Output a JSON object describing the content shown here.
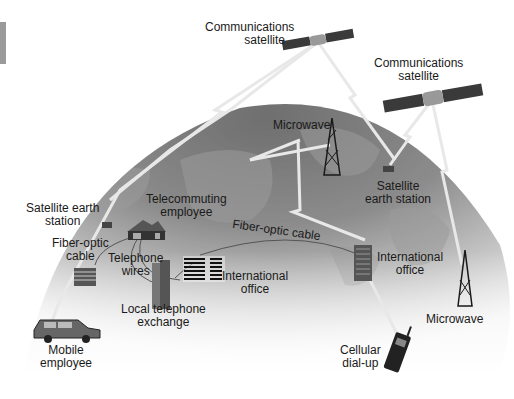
{
  "diagram": {
    "colors": {
      "globe_dark": "#7a7a7a",
      "globe_light": "#e8e8e8",
      "link": "#e6e6e6",
      "background": "#ffffff"
    },
    "labels": {
      "comm_sat_1": {
        "line1": "Communications",
        "line2": "satellite"
      },
      "comm_sat_2": {
        "line1": "Communications",
        "line2": "satellite"
      },
      "microwave_top": {
        "line1": "Microwave"
      },
      "sat_earth_station_right": {
        "line1": "Satellite",
        "line2": "earth station"
      },
      "sat_earth_station_left": {
        "line1": "Satellite earth",
        "line2": "station"
      },
      "telecommuting": {
        "line1": "Telecommuting",
        "line2": "employee"
      },
      "fiber_optic_left": {
        "line1": "Fiber-optic",
        "line2": "cable"
      },
      "fiber_optic_arc": {
        "line1": "Fiber-optic cable"
      },
      "telephone_wires": {
        "line1": "Telephone",
        "line2": "wires"
      },
      "intl_office_center": {
        "line1": "International",
        "line2": "office"
      },
      "intl_office_right": {
        "line1": "International",
        "line2": "office"
      },
      "local_exchange": {
        "line1": "Local telephone",
        "line2": "exchange"
      },
      "mobile_employee": {
        "line1": "Mobile",
        "line2": "employee"
      },
      "cellular": {
        "line1": "Cellular",
        "line2": "dial-up"
      },
      "microwave_right": {
        "line1": "Microwave"
      }
    },
    "nodes": [
      "Communications satellite",
      "Communications satellite",
      "Microwave tower",
      "Satellite earth station",
      "Satellite earth station",
      "Telecommuting employee",
      "Local telephone exchange",
      "International office",
      "International office",
      "Mobile employee",
      "Cellular dial-up",
      "Microwave tower"
    ]
  }
}
